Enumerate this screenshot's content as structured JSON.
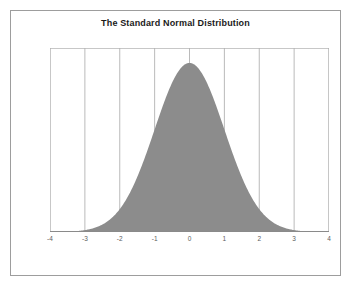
{
  "chart_data": {
    "type": "area",
    "title": "The Standard Normal Distribution",
    "xlabel": "",
    "ylabel": "",
    "xlim": [
      -4,
      4
    ],
    "ylim": [
      0,
      0.4342
    ],
    "grid": true,
    "grid_axis": "x",
    "legend": false,
    "legend_position": "none",
    "x_ticks": [
      -4,
      -3,
      -2,
      -1,
      0,
      1,
      2,
      3,
      4
    ],
    "x_tick_labels": [
      "-4",
      "-3",
      "-2",
      "-1",
      "0",
      "1",
      "2",
      "3",
      "4"
    ],
    "y_ticks": [],
    "y_tick_labels": [],
    "series": [
      {
        "name": "Standard Normal PDF",
        "fill_color": "#8c8c8c",
        "line_color": "#8c8c8c",
        "formula": "phi(x) = (1/sqrt(2*pi)) * exp(-x^2/2)",
        "x": [
          -4,
          -3.75,
          -3.5,
          -3.25,
          -3,
          -2.75,
          -2.5,
          -2.25,
          -2,
          -1.75,
          -1.5,
          -1.25,
          -1,
          -0.75,
          -0.5,
          -0.25,
          0,
          0.25,
          0.5,
          0.75,
          1,
          1.25,
          1.5,
          1.75,
          2,
          2.25,
          2.5,
          2.75,
          3,
          3.25,
          3.5,
          3.75,
          4
        ],
        "y": [
          0.0001,
          0.0004,
          0.0009,
          0.002,
          0.0044,
          0.0091,
          0.0175,
          0.0317,
          0.054,
          0.0863,
          0.1295,
          0.1826,
          0.242,
          0.3011,
          0.3521,
          0.3867,
          0.3989,
          0.3867,
          0.3521,
          0.3011,
          0.242,
          0.1826,
          0.1295,
          0.0863,
          0.054,
          0.0317,
          0.0175,
          0.0091,
          0.0044,
          0.002,
          0.0009,
          0.0004,
          0.0001
        ]
      }
    ],
    "colors": {
      "fill": "#8c8c8c",
      "gridline": "#a8a8a8",
      "frame": "#b0b0b0",
      "axis": "#8a8a8a",
      "title_text": "#1a1a1a",
      "tick_text": "#5c5c5c",
      "background": "#ffffff",
      "figure_border": "#9d9d9d"
    }
  }
}
